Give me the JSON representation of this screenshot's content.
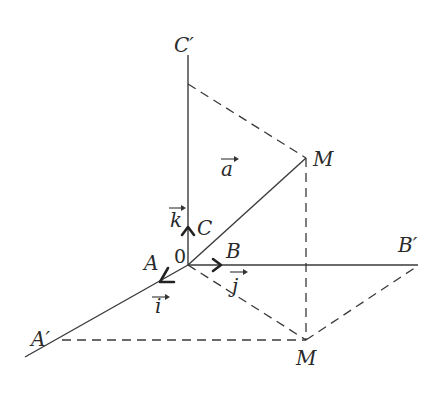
{
  "diagram": {
    "type": "3d-coordinate-vector",
    "labels": {
      "c_prime": "C′",
      "m_top": "M",
      "m_bottom": "M",
      "a_vec": "a",
      "k_vec": "k",
      "c": "C",
      "origin": "0",
      "b": "B",
      "b_prime": "B′",
      "a_point": "A",
      "i_vec": "i",
      "j_vec": "j",
      "a_prime": "A′"
    },
    "colors": {
      "line": "#3a3a3a",
      "text": "#2a2a2a",
      "background": "#ffffff"
    }
  }
}
